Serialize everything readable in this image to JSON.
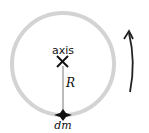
{
  "diagram": {
    "axis_label": "axis",
    "axis_marker": "X",
    "radius_label": "R",
    "mass_element_label": "dm",
    "ring_color": "#d3d3d3",
    "line_color": "#222222",
    "arrow_direction": "counterclockwise"
  }
}
